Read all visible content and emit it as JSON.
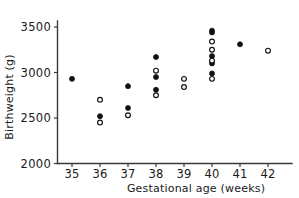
{
  "chart_data": {
    "type": "scatter",
    "title": "",
    "xlabel": "Gestational age (weeks)",
    "ylabel": "Birthweight (g)",
    "xlim": [
      34.4,
      42.9
    ],
    "ylim": [
      2000,
      3600
    ],
    "grid": false,
    "legend": "none",
    "xticks": [
      35,
      36,
      37,
      38,
      39,
      40,
      41,
      42
    ],
    "xtick_labels": [
      "35",
      "36",
      "37",
      "38",
      "39",
      "40",
      "41",
      "42"
    ],
    "yticks": [
      2000,
      2500,
      3000,
      3500
    ],
    "ytick_labels": [
      "2000",
      "2500",
      "3000",
      "3500"
    ],
    "marker_styles": {
      "filled": "solid black circle",
      "open": "open white circle with black outline"
    },
    "series": [
      {
        "name": "filled",
        "marker": "filled",
        "points": [
          {
            "x": 35,
            "y": 2930
          },
          {
            "x": 36,
            "y": 2520
          },
          {
            "x": 37,
            "y": 2850
          },
          {
            "x": 37,
            "y": 2610
          },
          {
            "x": 38,
            "y": 3170
          },
          {
            "x": 38,
            "y": 2950
          },
          {
            "x": 38,
            "y": 2810
          },
          {
            "x": 40,
            "y": 3460
          },
          {
            "x": 40,
            "y": 3440
          },
          {
            "x": 40,
            "y": 3180
          },
          {
            "x": 40,
            "y": 3100
          },
          {
            "x": 40,
            "y": 2990
          },
          {
            "x": 41,
            "y": 3310
          }
        ]
      },
      {
        "name": "open",
        "marker": "open",
        "points": [
          {
            "x": 36,
            "y": 2700
          },
          {
            "x": 36,
            "y": 2450
          },
          {
            "x": 37,
            "y": 2530
          },
          {
            "x": 38,
            "y": 3020
          },
          {
            "x": 38,
            "y": 2750
          },
          {
            "x": 39,
            "y": 2930
          },
          {
            "x": 39,
            "y": 2840
          },
          {
            "x": 40,
            "y": 3340
          },
          {
            "x": 40,
            "y": 3250
          },
          {
            "x": 40,
            "y": 3130
          },
          {
            "x": 40,
            "y": 2930
          },
          {
            "x": 42,
            "y": 3240
          }
        ]
      }
    ]
  }
}
